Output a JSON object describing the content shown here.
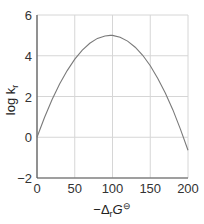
{
  "chart_data": {
    "type": "line",
    "title": "",
    "xlabel": "−ΔrG⊖",
    "ylabel": "log kr",
    "xlim": [
      0,
      200
    ],
    "ylim": [
      -2,
      6
    ],
    "x_ticks": [
      "0",
      "50",
      "100",
      "150",
      "200"
    ],
    "y_ticks": [
      "−2",
      "0",
      "2",
      "4",
      "6"
    ],
    "grid": true,
    "legend": null,
    "series": [
      {
        "name": "log kr vs −ΔrG⊖ (Marcus parabola)",
        "x": [
          0,
          10,
          20,
          30,
          40,
          50,
          60,
          70,
          80,
          90,
          97,
          100,
          110,
          120,
          130,
          140,
          150,
          160,
          170,
          180,
          190,
          200
        ],
        "y": [
          0.0,
          0.97,
          1.85,
          2.61,
          3.27,
          3.83,
          4.27,
          4.61,
          4.85,
          4.97,
          5.0,
          5.0,
          4.91,
          4.72,
          4.42,
          4.02,
          3.51,
          2.89,
          2.17,
          1.34,
          0.4,
          -0.64
        ]
      }
    ],
    "colors": {
      "line": "#7a7a7a",
      "grid": "#d6d6d6",
      "axis": "#555555"
    }
  },
  "labels": {
    "y_axis_main": "log k",
    "y_axis_sub": "r",
    "x_axis_minus": "−Δ",
    "x_axis_sub": "r",
    "x_axis_G": "G",
    "x_axis_sup": "⊖"
  }
}
